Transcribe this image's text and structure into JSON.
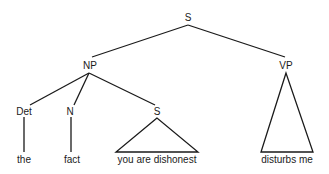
{
  "diagram": {
    "type": "syntax-tree",
    "nodes": {
      "root": {
        "label": "S"
      },
      "np": {
        "label": "NP"
      },
      "vp": {
        "label": "VP"
      },
      "det": {
        "label": "Det"
      },
      "n": {
        "label": "N"
      },
      "s_embedded": {
        "label": "S"
      }
    },
    "leaves": {
      "det": "the",
      "n": "fact",
      "s_embedded": "you are dishonest",
      "vp": "disturbs me"
    },
    "line_color": "#1a1a1a"
  }
}
